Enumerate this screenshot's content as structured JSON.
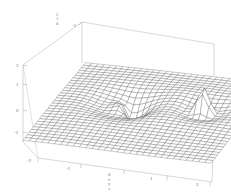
{
  "figure": {
    "kind": "3d-surface-mesh-plot",
    "background_color": "#ffffff",
    "line_color": "#555555",
    "box_color": "#9a9a9a",
    "label_color": "#6e6e6e"
  },
  "axes": {
    "x_axis": {
      "name": "x",
      "ticks": [
        "-2",
        "-1",
        "0",
        "1",
        "2"
      ],
      "range": [
        -2,
        2
      ],
      "label_stack": [
        "x",
        "y",
        "z"
      ]
    },
    "y_axis": {
      "name": "y",
      "ticks": [
        "-1"
      ],
      "range": [
        -2,
        2
      ]
    },
    "z_axis": {
      "name": "z",
      "ticks": [
        "2",
        "1",
        "0",
        "-1"
      ],
      "range": [
        -1,
        2
      ],
      "label_stack": [
        "2",
        "1",
        "0"
      ]
    }
  },
  "chart_data": {
    "type": "surface",
    "title": "",
    "xlabel": "",
    "ylabel": "",
    "zlabel": "",
    "grid": true,
    "legend": false,
    "xlim": [
      -2,
      2
    ],
    "ylim": [
      -2,
      2
    ],
    "zlim": [
      -1,
      2
    ],
    "x_ticks": [
      "-2",
      "-1",
      "0",
      "1",
      "2"
    ],
    "y_ticks": [
      "-1"
    ],
    "z_ticks": [
      "2",
      "1",
      "0",
      "-1"
    ],
    "mesh_nx": 30,
    "mesh_ny": 30,
    "features": [
      {
        "name": "left-fold-cliff",
        "kind": "discontinuity",
        "x": -0.55,
        "y": 0.25,
        "description": "downward fold / cliff in surface"
      },
      {
        "name": "right-spike-pole",
        "kind": "singularity",
        "x": 1.05,
        "y": 0.35,
        "description": "sharp upward spike / pole"
      }
    ],
    "base_level": 0
  },
  "ticks_rendered": {
    "bottom": [
      {
        "text": "-2",
        "left": 27,
        "top": 158
      },
      {
        "text": "-1",
        "left": 66,
        "top": 166
      },
      {
        "text": "0",
        "left": 108,
        "top": 172
      },
      {
        "text": "1",
        "left": 150,
        "top": 176
      },
      {
        "text": "2",
        "left": 196,
        "top": 182
      }
    ],
    "left": [
      {
        "text": "2",
        "left": 16,
        "top": 63
      },
      {
        "text": "1",
        "left": 16,
        "top": 82
      },
      {
        "text": "0",
        "left": 16,
        "top": 108
      },
      {
        "text": "-1",
        "left": 14,
        "top": 130
      }
    ],
    "back": [
      {
        "text": "-1",
        "left": 72,
        "top": 23
      }
    ]
  },
  "stacks": {
    "top_left": {
      "left": 56,
      "top": 13,
      "items": [
        "2",
        "1",
        "0"
      ]
    },
    "bottom_center": {
      "left": 108,
      "top": 178,
      "items": [
        "x",
        "y",
        "z"
      ]
    }
  }
}
